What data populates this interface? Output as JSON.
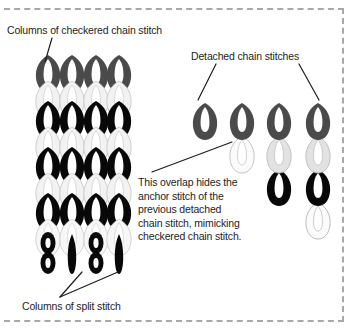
{
  "figure": {
    "background_color": "#ffffff",
    "frame": {
      "style": "dashed",
      "color": "#a8a8a8"
    }
  },
  "labels": {
    "checkered": "Columns of checkered chain stitch",
    "detached": "Detached chain stitches",
    "split": "Columns of split stitch",
    "overlap": "This overlap hides the anchor stitch of the previous detached chain stitch, mimicking checkered chain stitch."
  },
  "colors": {
    "dark_gray": "#4a4a4a",
    "black": "#050505",
    "light_gray": "#e2e2e2",
    "outline_gray": "#b4b4b4",
    "white": "#ffffff",
    "text": "#1d1d1d",
    "leader_line": "#1d1d1d"
  },
  "left_panel": {
    "description": "Four vertical columns of alternating checkered chain stitches over split stitch columns",
    "column_count": 4,
    "column_x": [
      48,
      72,
      96,
      118
    ],
    "row_count": 6,
    "row_y": [
      68,
      104,
      140,
      176,
      212,
      248
    ],
    "row_fills": [
      "dark_gray",
      "black",
      "black",
      "black",
      "light_gray",
      "black"
    ],
    "split_stitch_row": {
      "y": 250,
      "fill": "black",
      "note": "narrow figure-eight and spike shapes"
    }
  },
  "right_panel": {
    "description": "Four progressive columns showing detached chain stitches accumulating downward",
    "columns": [
      {
        "x": 205,
        "top": 100,
        "stitches": [
          "dark_gray"
        ]
      },
      {
        "x": 238,
        "top": 100,
        "stitches": [
          "dark_gray",
          "white"
        ]
      },
      {
        "x": 275,
        "top": 100,
        "stitches": [
          "dark_gray",
          "light_gray",
          "black"
        ]
      },
      {
        "x": 314,
        "top": 100,
        "stitches": [
          "dark_gray",
          "light_gray",
          "black",
          "white"
        ]
      }
    ],
    "stitch_spacing": 30
  },
  "leader_lines": [
    {
      "name": "checkered-leader",
      "from": [
        52,
        37
      ],
      "to": [
        45,
        62
      ]
    },
    {
      "name": "detached-leader-left",
      "from": [
        215,
        63
      ],
      "to": [
        198,
        96
      ]
    },
    {
      "name": "detached-leader-right",
      "from": [
        300,
        63
      ],
      "to": [
        318,
        96
      ]
    },
    {
      "name": "overlap-leader",
      "from": [
        152,
        172
      ],
      "to": [
        228,
        140
      ]
    },
    {
      "name": "split-leader-left",
      "from": [
        59,
        297
      ],
      "to": [
        80,
        268
      ]
    },
    {
      "name": "split-leader-right",
      "from": [
        59,
        297
      ],
      "to": [
        118,
        268
      ]
    }
  ]
}
